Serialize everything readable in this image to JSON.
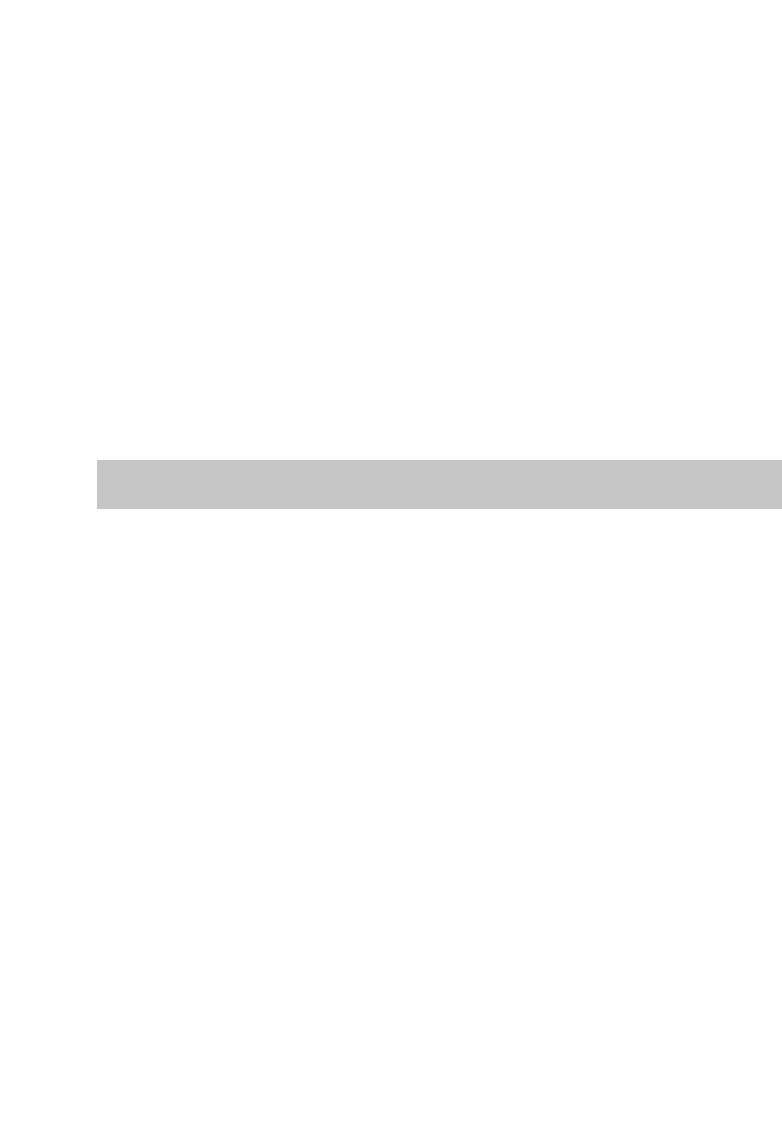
{
  "page": {
    "type": "blank scanned page",
    "background_color": "#fefefe"
  },
  "bar": {
    "label": "",
    "color": "#c6c6c6"
  }
}
